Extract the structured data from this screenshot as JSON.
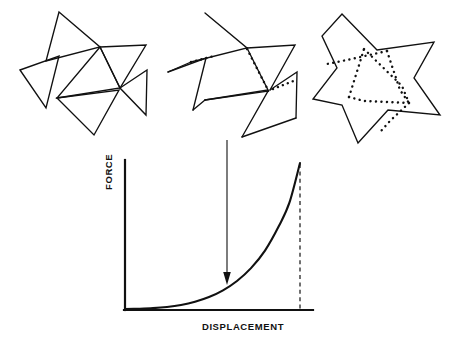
{
  "figure": {
    "background_color": "#ffffff",
    "stroke_color": "#111111",
    "panels": [
      {
        "id": "panel-left",
        "name": "stage-1-collapsed-pinwheel",
        "caption": "",
        "description": "Six overlapping triangles arranged as a collapsed pinwheel rosette",
        "dotted_edges": 0
      },
      {
        "id": "panel-middle",
        "name": "stage-2-partially-deployed",
        "caption": "",
        "description": "Partially unfolded pinwheel with dotted hidden fold lines appearing",
        "dotted_edges": 3
      },
      {
        "id": "panel-right",
        "name": "stage-3-deployed-star",
        "caption": "",
        "description": "Fully deployed six-pointed star outline with dotted internal fold lines",
        "dotted_edges": 6
      }
    ],
    "annotation_arrow": {
      "name": "downward-arrow",
      "description": "Arrow pointing from the middle deformation panel down to the force-displacement curve",
      "direction": "down"
    }
  },
  "chart_data": {
    "type": "line",
    "title": "",
    "xlabel": "DISPLACEMENT",
    "ylabel": "FORCE",
    "xlim": [
      0,
      1
    ],
    "ylim": [
      0,
      1
    ],
    "grid": false,
    "legend": null,
    "axis_ticks": {
      "x": [],
      "y": []
    },
    "series": [
      {
        "name": "force-displacement",
        "style": "solid",
        "x": [
          0.0,
          0.08,
          0.16,
          0.24,
          0.32,
          0.4,
          0.48,
          0.56,
          0.64,
          0.72,
          0.8,
          0.88,
          0.94,
          1.0
        ],
        "y": [
          0.0,
          0.002,
          0.006,
          0.014,
          0.028,
          0.05,
          0.082,
          0.128,
          0.192,
          0.28,
          0.4,
          0.57,
          0.73,
          1.0
        ]
      }
    ],
    "annotations": [
      {
        "name": "peak-dashed-guide",
        "type": "vertical-dashed-line",
        "x": 1.0,
        "y_from": 0.0,
        "y_to": 1.0,
        "style": "dashed"
      },
      {
        "name": "loading-arrow",
        "type": "arrow",
        "x": 0.535,
        "y_from": 1.42,
        "y_to": 0.18,
        "direction": "down"
      }
    ]
  },
  "labels": {
    "y_axis": "FORCE",
    "x_axis": "DISPLACEMENT"
  }
}
